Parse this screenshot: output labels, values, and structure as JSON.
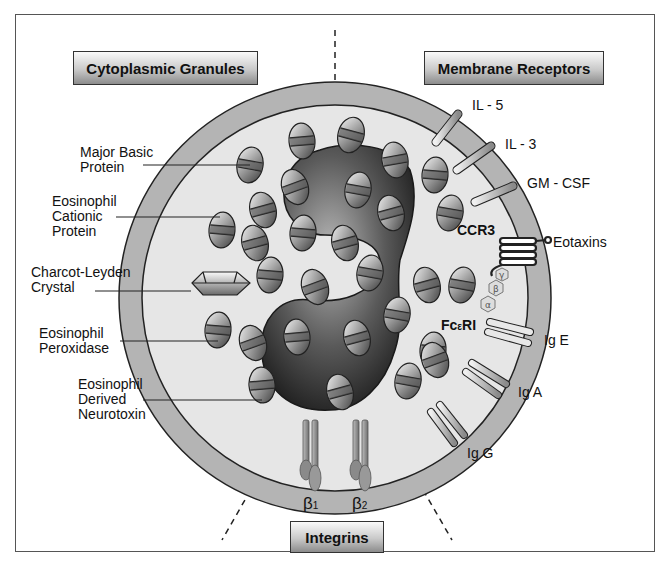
{
  "headers": {
    "cytoplasmic": "Cytoplasmic Granules",
    "membrane": "Membrane Receptors",
    "integrins": "Integrins"
  },
  "granule_labels": [
    {
      "id": "mbp",
      "lines": [
        "Major Basic",
        "Protein"
      ]
    },
    {
      "id": "ecp",
      "lines": [
        "Eosinophil",
        "Cationic",
        "Protein"
      ]
    },
    {
      "id": "clc",
      "lines": [
        "Charcot-Leyden",
        "Crystal"
      ]
    },
    {
      "id": "epo",
      "lines": [
        "Eosinophil",
        "Peroxidase"
      ]
    },
    {
      "id": "edn",
      "lines": [
        "Eosinophil",
        "Derived",
        "Neurotoxin"
      ]
    }
  ],
  "receptor_labels": {
    "il5": "IL - 5",
    "il3": "IL - 3",
    "gmcsf": "GM - CSF",
    "ccr3": "CCR3",
    "eotaxins": "Eotaxins",
    "fcer1_main": "Fc",
    "fcer1_sub": "ε",
    "fcer1_tail": "RI",
    "ige": "Ig E",
    "iga": "Ig A",
    "igg": "Ig G"
  },
  "g_protein_subunits": [
    "γ",
    "β",
    "α"
  ],
  "integrin_labels": {
    "b1": "β",
    "b1_sub": "1",
    "b2": "β",
    "b2_sub": "2"
  },
  "colors": {
    "membrane": "#b4b4b4",
    "cytoplasm": "#e6e6e6",
    "nucleus": "#4a4a4a",
    "outline": "#222222"
  }
}
